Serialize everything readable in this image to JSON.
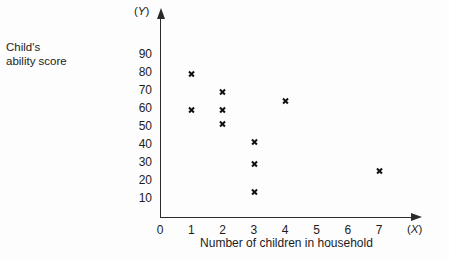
{
  "labels": {
    "y_caption": "Child's\nability score",
    "x_caption": "Number of children in household",
    "y_symbol_open": "(",
    "y_symbol_var": "Y",
    "y_symbol_close": ")",
    "x_symbol_open": "(",
    "x_symbol_var": "X",
    "x_symbol_close": ")"
  },
  "colors": {
    "ink": "#1c1c1c",
    "axis": "#2a2a2a",
    "marker": "#111111",
    "background": "#fdfdfd"
  },
  "chart_data": {
    "type": "scatter",
    "title": "",
    "xlabel": "Number of children in household",
    "ylabel": "Child's ability score",
    "x_symbol": "X",
    "y_symbol": "Y",
    "xlim": [
      0,
      7.8
    ],
    "ylim": [
      0,
      95
    ],
    "grid": false,
    "legend": null,
    "xticks": [
      0,
      1,
      2,
      3,
      4,
      5,
      6,
      7
    ],
    "xtick_labels": [
      "0",
      "1",
      "2",
      "3",
      "4",
      "5",
      "6",
      "7"
    ],
    "yticks": [
      10,
      20,
      30,
      40,
      50,
      60,
      70,
      80,
      90
    ],
    "ytick_labels": [
      "10",
      "20",
      "30",
      "40",
      "50",
      "60",
      "70",
      "80",
      "90"
    ],
    "marker": "x",
    "points": [
      {
        "x": 1,
        "y": 80
      },
      {
        "x": 1,
        "y": 60
      },
      {
        "x": 2,
        "y": 70
      },
      {
        "x": 2,
        "y": 60
      },
      {
        "x": 2,
        "y": 52
      },
      {
        "x": 3,
        "y": 42
      },
      {
        "x": 3,
        "y": 30
      },
      {
        "x": 3,
        "y": 14
      },
      {
        "x": 4,
        "y": 65
      },
      {
        "x": 7,
        "y": 26
      }
    ]
  }
}
